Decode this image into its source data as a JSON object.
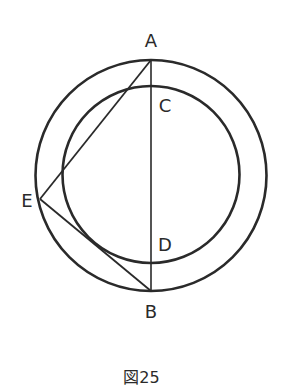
{
  "caption": "図25",
  "colors": {
    "stroke": "#2a2a2a",
    "background": "#ffffff"
  },
  "geometry": {
    "outer_circle": {
      "cx": 151,
      "cy": 175.5,
      "r": 115.5
    },
    "inner_circle": {
      "cx": 151,
      "cy": 174.5,
      "r": 88.5
    },
    "points": {
      "A": {
        "x": 151,
        "y": 60
      },
      "B": {
        "x": 151,
        "y": 291
      },
      "C": {
        "x": 151,
        "y": 86
      },
      "D": {
        "x": 151,
        "y": 263
      },
      "E": {
        "x": 40,
        "y": 199
      }
    },
    "segments": [
      [
        "A",
        "B"
      ],
      [
        "E",
        "A"
      ],
      [
        "E",
        "B"
      ]
    ]
  },
  "labels": {
    "A": {
      "text": "A",
      "x": 151,
      "y": 47
    },
    "B": {
      "text": "B",
      "x": 151,
      "y": 318
    },
    "C": {
      "text": "C",
      "x": 165,
      "y": 112
    },
    "D": {
      "text": "D",
      "x": 165,
      "y": 251
    },
    "E": {
      "text": "E",
      "x": 27,
      "y": 207
    }
  }
}
